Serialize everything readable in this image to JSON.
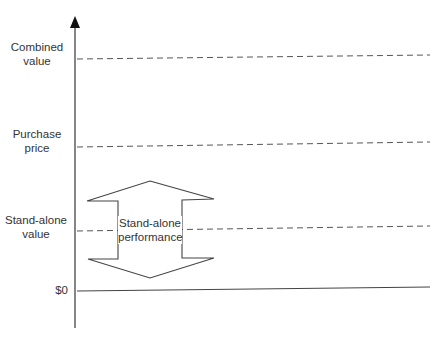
{
  "diagram": {
    "axis": {
      "direction": "vertical",
      "arrow": "up"
    },
    "levels": [
      {
        "id": "combined",
        "label_line1": "Combined",
        "label_line2": "value",
        "style": "dashed"
      },
      {
        "id": "purchase",
        "label_line1": "Purchase",
        "label_line2": "price",
        "style": "dashed"
      },
      {
        "id": "standalone",
        "label_line1": "Stand-alone",
        "label_line2": "value",
        "style": "dashed"
      },
      {
        "id": "zero",
        "label_line1": "$0",
        "style": "solid"
      }
    ],
    "double_arrow": {
      "label_line1": "Stand-alone",
      "label_line2": "performance"
    },
    "colors": {
      "line": "#444444",
      "dash": "#555555",
      "text": "#333333"
    }
  }
}
